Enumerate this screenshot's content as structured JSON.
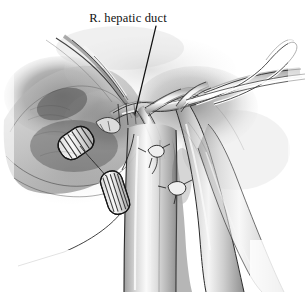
{
  "figure": {
    "kind": "medical-surgical-illustration",
    "medium": "grayscale pen-and-ink / wash drawing",
    "width_px": 305,
    "height_px": 294,
    "background_color": "#ffffff",
    "ink_color": "#1a1a1a",
    "title": "R. hepatic duct"
  },
  "annotations": [
    {
      "id": "r-hepatic-duct",
      "label": "R. hepatic duct",
      "text_x": 128,
      "text_y": 22,
      "leader": {
        "x1": 156,
        "y1": 26,
        "x2": 135,
        "y2": 114
      }
    }
  ],
  "structures": {
    "hepatic_duct_label": "R. hepatic duct",
    "vessel_loop_label": "vessel-loop",
    "clip_upper_left_label": "surgical-clip-upper-left",
    "clip_lower_left_label": "surgical-clip-lower-left",
    "suture_knot_upper_label": "suture-knot-upper",
    "suture_knot_lower_label": "suture-knot-lower",
    "portal_vein_label": "portal-vein",
    "hepatic_artery_label": "hepatic-artery"
  },
  "palette": {
    "ink": "#1a1a1a",
    "line": "#2b2b2b",
    "shade_dark": "#4a4a4a",
    "shade_mid": "#8d8d8d",
    "shade_light": "#c9c9c9",
    "tissue_pale": "#e8e8e8",
    "highlight": "#fbfbfb",
    "paper": "#ffffff"
  }
}
